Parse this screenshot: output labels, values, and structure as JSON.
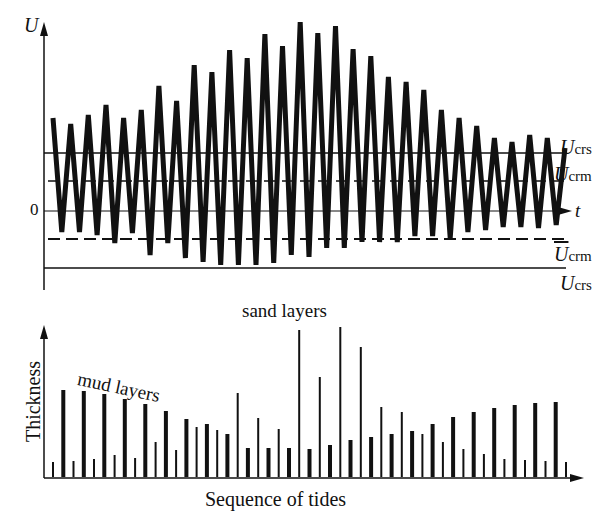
{
  "top_panel": {
    "y_axis_label": "U",
    "x_axis_label": "t",
    "zero_label": "0",
    "thresholds": [
      {
        "label": "U",
        "subscript": "crs",
        "style": "solid",
        "position": "upper"
      },
      {
        "label": "U",
        "subscript": "crm",
        "style": "dashed",
        "position": "upper"
      },
      {
        "label": "U",
        "subscript": "crm",
        "style": "dashed",
        "position": "lower",
        "overbar": true
      },
      {
        "label": "U",
        "subscript": "crs",
        "style": "solid",
        "position": "lower"
      }
    ],
    "description": "Tidal current velocity oscillating around zero over spring-neap cycle"
  },
  "bottom_panel": {
    "y_axis_label": "Thickness",
    "x_axis_label": "Sequence of tides",
    "annotations": [
      "sand layers",
      "mud layers"
    ]
  },
  "chart_data": [
    {
      "type": "line",
      "title": "",
      "xlabel": "t",
      "ylabel": "U",
      "peaks_high": [
        118,
        124,
        115,
        105,
        118,
        110,
        86,
        101,
        65,
        72,
        50,
        58,
        34,
        46,
        22,
        33,
        26,
        49,
        56,
        77,
        82,
        90,
        110,
        118,
        126,
        138,
        142,
        135,
        138,
        148
      ],
      "troughs_low": [
        232,
        232,
        235,
        243,
        233,
        255,
        243,
        258,
        262,
        265,
        265,
        265,
        263,
        255,
        257,
        248,
        248,
        242,
        242,
        242,
        236,
        236,
        238,
        232,
        230,
        227,
        227,
        228,
        225
      ],
      "thresholds": {
        "U_crs_upper": 153,
        "U_crm_upper": 181,
        "zero": 211,
        "U_crm_lower": 239,
        "U_crs_lower": 268
      },
      "grid": false
    },
    {
      "type": "bar",
      "title": "",
      "xlabel": "Sequence of tides",
      "ylabel": "Thickness",
      "categories_count": 51,
      "series": [
        {
          "name": "mud layers",
          "values": [
            0,
            87,
            0,
            86,
            0,
            83,
            0,
            78,
            0,
            73,
            0,
            66,
            0,
            58,
            0,
            53,
            0,
            43,
            0,
            29,
            0,
            29,
            0,
            29,
            0,
            28,
            0,
            32,
            0,
            37,
            0,
            40,
            0,
            43,
            0,
            46,
            0,
            53,
            0,
            60,
            0,
            65,
            0,
            69,
            0,
            72,
            0,
            74,
            0,
            75,
            0
          ]
        },
        {
          "name": "sand layers",
          "values": [
            15,
            0,
            16,
            0,
            18,
            0,
            22,
            0,
            19,
            0,
            35,
            0,
            27,
            0,
            50,
            0,
            47,
            0,
            84,
            0,
            59,
            0,
            48,
            0,
            147,
            0,
            100,
            0,
            150,
            0,
            130,
            0,
            70,
            0,
            65,
            0,
            43,
            0,
            35,
            0,
            28,
            0,
            23,
            0,
            18,
            0,
            17,
            0,
            16,
            0,
            15
          ]
        }
      ]
    }
  ]
}
